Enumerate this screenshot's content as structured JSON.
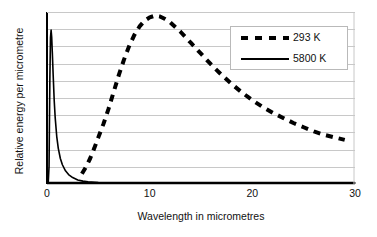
{
  "chart_data": {
    "type": "line",
    "title": "",
    "xlabel": "Wavelength in micrometres",
    "ylabel": "Relative energy per micrometre",
    "xlim": [
      0,
      30
    ],
    "ylim": [
      0,
      1
    ],
    "xticks": [
      0,
      10,
      20,
      30
    ],
    "xticklabels": [
      "0",
      "10",
      "20",
      "30"
    ],
    "yticks": [],
    "yticklabels": [],
    "grid": "horizontal",
    "gridline_count": 9,
    "legend_position": "upper right",
    "series": [
      {
        "name": "293 K",
        "style": "dashed",
        "color": "#000000",
        "linewidth": 4,
        "x": [
          3.4,
          3.8,
          4.2,
          4.6,
          5.0,
          5.5,
          6.0,
          6.5,
          7.0,
          7.5,
          8.0,
          8.5,
          9.0,
          9.5,
          10.0,
          10.5,
          11.0,
          11.5,
          12.0,
          13.0,
          14.0,
          15.0,
          16.0,
          17.0,
          18.0,
          19.0,
          20.0,
          21.0,
          22.0,
          23.0,
          24.0,
          25.0,
          26.0,
          27.0,
          28.0,
          29.0
        ],
        "y": [
          0.055,
          0.095,
          0.145,
          0.205,
          0.27,
          0.35,
          0.44,
          0.54,
          0.64,
          0.73,
          0.81,
          0.875,
          0.925,
          0.96,
          0.98,
          0.99,
          0.985,
          0.97,
          0.95,
          0.895,
          0.83,
          0.765,
          0.7,
          0.64,
          0.585,
          0.535,
          0.49,
          0.45,
          0.415,
          0.385,
          0.355,
          0.33,
          0.305,
          0.285,
          0.27,
          0.255
        ]
      },
      {
        "name": "5800 K",
        "style": "solid",
        "color": "#000000",
        "linewidth": 1.6,
        "x": [
          0.12,
          0.2,
          0.28,
          0.34,
          0.4,
          0.46,
          0.52,
          0.6,
          0.7,
          0.8,
          0.95,
          1.1,
          1.3,
          1.5,
          1.8,
          2.1,
          2.5,
          3.0,
          3.5,
          4.0,
          5.0,
          7.0,
          10.0,
          15.0,
          20.0,
          25.0,
          30.0
        ],
        "y": [
          0.0,
          0.1,
          0.62,
          0.86,
          0.905,
          0.86,
          0.77,
          0.64,
          0.49,
          0.385,
          0.275,
          0.205,
          0.145,
          0.108,
          0.072,
          0.05,
          0.032,
          0.018,
          0.011,
          0.007,
          0.003,
          0.001,
          0.0,
          0.0,
          0.0,
          0.0,
          0.0
        ]
      }
    ]
  },
  "legend": {
    "entries": [
      {
        "label": "293 K",
        "marker": "dashed-line"
      },
      {
        "label": "5800 K",
        "marker": "solid-line"
      }
    ]
  },
  "colors": {
    "axis": "#000000",
    "gridline": "#c8c8c8",
    "plot_background": "#ffffff",
    "legend_border": "#b9b9b9"
  }
}
